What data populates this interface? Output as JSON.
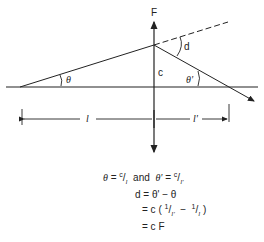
{
  "diagram": {
    "labels": {
      "focal": "F",
      "deviation": "d",
      "height": "c",
      "theta": "θ",
      "theta_prime": "θ'",
      "l": "l",
      "l_prime": "l'"
    },
    "equations": {
      "line1_theta": "θ",
      "line1_eq": " = ",
      "line1_c": "c",
      "line1_slash": "/",
      "line1_l": "l",
      "line1_and": "  and  ",
      "line1_thetap": "θ'",
      "line1_eq2": " = ",
      "line1_c2": "c",
      "line1_slash2": "/",
      "line1_lp": "l'",
      "line2": "d = θ' − θ",
      "line3_prefix": "= c ( ",
      "line3_one": "1",
      "line3_slash": "/",
      "line3_lp": "l'",
      "line3_minus": "  −  ",
      "line3_one2": "1",
      "line3_slash2": "/",
      "line3_l": "l",
      "line3_suffix": " )",
      "line4": "= c F"
    },
    "colors": {
      "stroke": "#222222",
      "background": "#ffffff"
    }
  }
}
